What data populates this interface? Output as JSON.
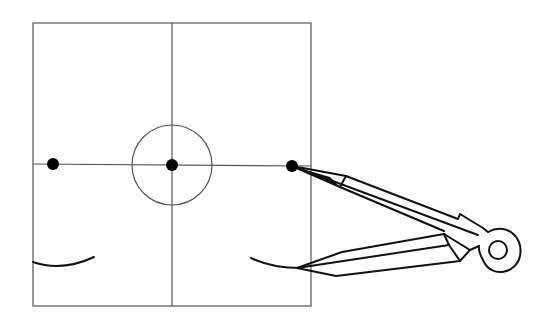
{
  "canvas": {
    "width": 559,
    "height": 326,
    "background": "#ffffff"
  },
  "colors": {
    "grid_line": "#555555",
    "ink": "#111111",
    "dot": "#000000"
  },
  "frame": {
    "x": 33,
    "y": 23,
    "width": 278,
    "height": 283
  },
  "axes": {
    "horizontal": {
      "x1": 33,
      "y1": 164,
      "x2": 311,
      "y2": 166
    },
    "vertical": {
      "x1": 172,
      "y1": 23,
      "x2": 172,
      "y2": 306
    }
  },
  "center_circle": {
    "cx": 172,
    "cy": 165,
    "r": 40
  },
  "points": [
    {
      "name": "left-point",
      "cx": 53,
      "cy": 164,
      "r": 6
    },
    {
      "name": "center-point",
      "cx": 172,
      "cy": 165,
      "r": 6
    },
    {
      "name": "right-point",
      "cx": 292,
      "cy": 166,
      "r": 6
    }
  ],
  "arcs": [
    {
      "name": "left-arc",
      "d": "M33 262 Q62 272 94 257"
    },
    {
      "name": "right-arc",
      "d": "M251 258 Q272 268 300 268"
    }
  ],
  "compass": {
    "upper_leg": {
      "tip": "M292 166 L330 177 L340 187 Z",
      "outline": "M292 166 L346 176 L458 219 L460 214 L483 228 L488 232",
      "lower_edge": "M292 166 L340 187 L444 231",
      "inner_line": "M292 166 L330 180 L478 235",
      "bevel": "M346 176 L340 187"
    },
    "lower_leg": {
      "outline": "M297 268 L342 252 L444 234",
      "lower_edge": "M297 268 L336 276 L460 261",
      "inner_line": "M297 268 L449 245",
      "knuckle": "M444 234 L470 250 L460 261 L449 245 Z",
      "knuckle_link": "M470 250 L479 246"
    },
    "hinge": {
      "outer": "M488 232 C505 222 524 236 520 256 C516 274 492 278 484 262 C481 256 478 252 479 246",
      "hole": {
        "cx": 498,
        "cy": 250,
        "r": 9
      }
    }
  }
}
